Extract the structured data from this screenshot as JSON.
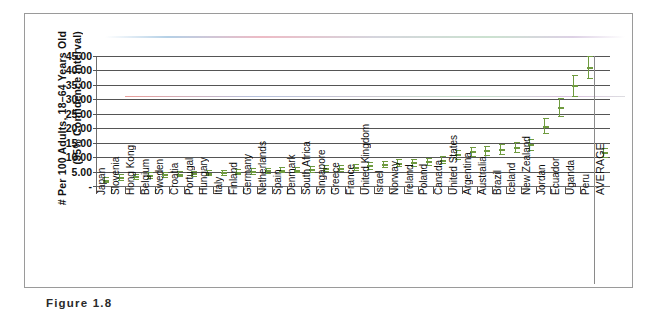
{
  "figure": {
    "caption": "Figure  1.8"
  },
  "chart_data": {
    "type": "scatter",
    "title": "",
    "subtitle": "",
    "xlabel": "",
    "ylabel": "# Per 100 Adults, 18–64 Years Old (95% Confidence Interval)",
    "ylabel_line1": "# Per 100 Adults, 18–64 Years Old",
    "ylabel_line2": "(95% Confidence Interval)",
    "ylim": [
      0,
      45
    ],
    "ytick_labels": [
      "-",
      "5.00",
      "10.00",
      "15.00",
      "20.00",
      "25.00",
      "30.00",
      "35.00",
      "40.00",
      "45.00"
    ],
    "ytick_values": [
      0,
      5,
      10,
      15,
      20,
      25,
      30,
      35,
      40,
      45
    ],
    "grid": true,
    "legend_position": "none",
    "marker_color": "#6f9b3f",
    "categories": [
      "Japan",
      "Slovenia",
      "Hong Kong",
      "Belgium",
      "Sweden",
      "Croatia",
      "Portugal",
      "Hungary",
      "Italy",
      "Finland",
      "Germany",
      "Netherlands",
      "Spain",
      "Denmark",
      "South Africa",
      "Singapore",
      "Greece",
      "France",
      "United Kingdom",
      "Israel",
      "Norway",
      "Ireland",
      "Poland",
      "Canada",
      "United States",
      "Argentina",
      "Australia",
      "Brazil",
      "Iceland",
      "New Zealand",
      "Jordan",
      "Ecuador",
      "Uganda",
      "Peru",
      "AVERAGE"
    ],
    "values": [
      2.2,
      3.1,
      3.4,
      3.8,
      4.0,
      4.2,
      4.4,
      4.6,
      4.7,
      4.9,
      5.2,
      5.4,
      5.6,
      5.7,
      5.9,
      6.1,
      6.3,
      6.5,
      7.1,
      7.6,
      8.0,
      8.2,
      8.5,
      9.1,
      11.0,
      12.0,
      12.4,
      12.8,
      13.4,
      14.4,
      20.9,
      27.3,
      34.8,
      41.2,
      11.6
    ],
    "ci_low": [
      1.4,
      2.1,
      2.5,
      2.9,
      3.1,
      3.3,
      3.5,
      3.7,
      3.8,
      4.0,
      4.3,
      4.5,
      4.7,
      4.8,
      4.9,
      5.1,
      5.3,
      5.5,
      6.0,
      6.4,
      6.8,
      7.0,
      7.2,
      7.8,
      9.5,
      10.4,
      10.8,
      11.1,
      11.6,
      12.5,
      18.4,
      24.3,
      31.3,
      37.4,
      10.2
    ],
    "ci_high": [
      3.0,
      4.1,
      4.3,
      4.7,
      4.9,
      5.1,
      5.3,
      5.5,
      5.6,
      5.8,
      6.1,
      6.3,
      6.5,
      6.6,
      6.9,
      7.1,
      7.3,
      7.5,
      8.2,
      8.8,
      9.2,
      9.4,
      9.8,
      10.4,
      12.5,
      13.6,
      14.0,
      14.5,
      15.2,
      16.3,
      23.4,
      30.3,
      38.3,
      45.0,
      13.0
    ],
    "average_separator_after_index": 33
  }
}
